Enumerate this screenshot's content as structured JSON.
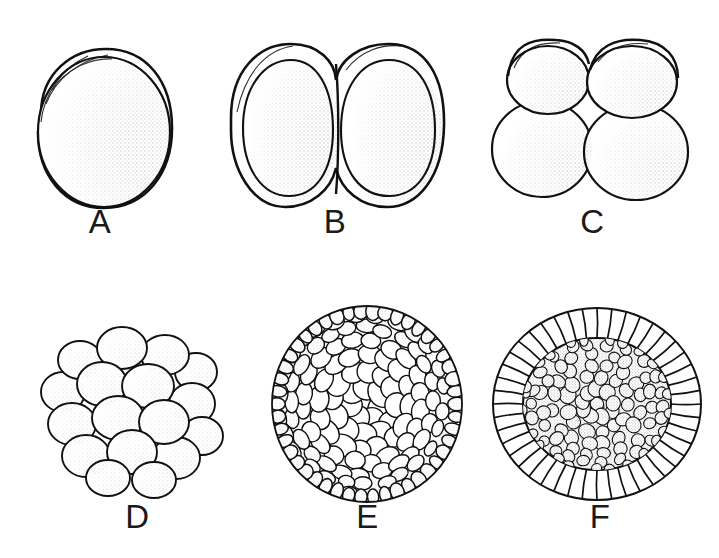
{
  "figure": {
    "style": "pen-and-ink stipple line drawing",
    "background_color": "#ffffff",
    "ink_color": "#111111",
    "layout": {
      "rows": 2,
      "columns": 3,
      "panel_count": 6
    }
  },
  "panels": [
    {
      "id": "a",
      "label": "A",
      "stage_name": "zygote / one-cell stage",
      "cell_count": 1,
      "shading": "stippled right and lower-right, highlight upper-left",
      "features": "single spherical cell with thin crescent-shaped perivitelline space at upper left"
    },
    {
      "id": "b",
      "label": "B",
      "stage_name": "two-cell stage",
      "cell_count": 2,
      "shading": "stippled along right edge of each blastomere",
      "features": "two equal blastomeres pressed together along a flat vertical contact plane"
    },
    {
      "id": "c",
      "label": "C",
      "stage_name": "four-cell stage",
      "cell_count": 4,
      "shading": "stippled on lower-right of each blastomere",
      "features": "two smaller blastomeres above, two larger blastomeres below, in a 2 by 2 arrangement"
    },
    {
      "id": "d",
      "label": "D",
      "stage_name": "early morula",
      "cell_count": 28,
      "shading": "light stipple on each rounded blastomere",
      "features": "compact mulberry-like cluster of rounded blastomeres of similar size"
    },
    {
      "id": "e",
      "label": "E",
      "stage_name": "late morula / blastula",
      "cell_count": 120,
      "shading": "stipple heaviest around the rim",
      "features": "spherical embryo covered by many small overlapping surface blastomeres"
    },
    {
      "id": "f",
      "label": "F",
      "stage_name": "blastula cross-section",
      "cell_count": 42,
      "shading": "dense stipple in the inner cell mass, outer cells left unshaded",
      "features": "sectional view with a radial ring of columnar outer cells surrounding a dark granular inner cell mass"
    }
  ]
}
